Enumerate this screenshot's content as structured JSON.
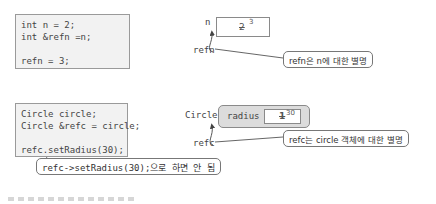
{
  "example1": {
    "code": [
      "int n = 2;",
      "int &refn =n;",
      "",
      "refn = 3;"
    ],
    "var_label": "n",
    "ref_label": "refn",
    "old_value": "2",
    "new_value": "3",
    "callout": "refn은 n에 대한 별명"
  },
  "example2": {
    "code": [
      "Circle circle;",
      "Circle &refc = circle;",
      "",
      "refc.setRadius(30);"
    ],
    "class_label": "Circle",
    "member_label": "radius",
    "old_value": "1",
    "new_value": "30",
    "ref_label": "refc",
    "callout": "refc는 circle 객체에 대한 별명",
    "warning_callout": "refc->setRadius(30);으로 하면 안 됨"
  },
  "colors": {
    "code_bg": "#f2f2f2",
    "object_bg": "#dcdcdc",
    "border": "#8a8a8a"
  }
}
